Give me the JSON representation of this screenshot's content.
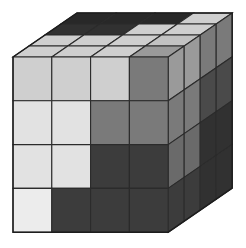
{
  "figure": {
    "background_color": "#ffffff",
    "edge_color": "#2b2b2b",
    "grid": {
      "columns": 4,
      "rows": 4,
      "depth": 4
    }
  },
  "palette": {
    "white": "#ececec",
    "very_light": "#e2e2e2",
    "light": "#cfcfcf",
    "light_mid": "#c2c2c2",
    "mid": "#9a9a9a",
    "medium": "#7a7a7a",
    "medium_dark": "#6a6a6a",
    "dark": "#4a4a4a",
    "darker": "#3c3c3c",
    "very_dark": "#313131",
    "near_black": "#282828"
  },
  "geometry": {
    "front_top_left_x": 13,
    "front_top_left_y": 57,
    "cell_width": 38.8,
    "cell_height": 43.8,
    "depth_step_x": 16.0,
    "depth_step_y": -11.0,
    "depth_layers": 4
  },
  "faces": {
    "front": {
      "name": "front-face",
      "rows": [
        [
          "light",
          "light",
          "light",
          "medium"
        ],
        [
          "very_light",
          "very_light",
          "medium",
          "medium"
        ],
        [
          "very_light",
          "very_light",
          "darker",
          "darker"
        ],
        [
          "white",
          "darker",
          "darker",
          "darker"
        ]
      ]
    },
    "top": {
      "name": "top-face",
      "rows": [
        [
          "near_black",
          "near_black",
          "near_black",
          "light"
        ],
        [
          "very_dark",
          "very_dark",
          "light",
          "light"
        ],
        [
          "light",
          "light",
          "light",
          "light_mid"
        ],
        [
          "light",
          "light",
          "light",
          "mid"
        ]
      ]
    },
    "right": {
      "name": "right-face",
      "rows": [
        [
          "mid",
          "mid",
          "medium",
          "medium"
        ],
        [
          "medium",
          "medium",
          "dark",
          "dark"
        ],
        [
          "medium_dark",
          "medium_dark",
          "very_dark",
          "very_dark"
        ],
        [
          "darker",
          "darker",
          "very_dark",
          "very_dark"
        ]
      ]
    }
  }
}
